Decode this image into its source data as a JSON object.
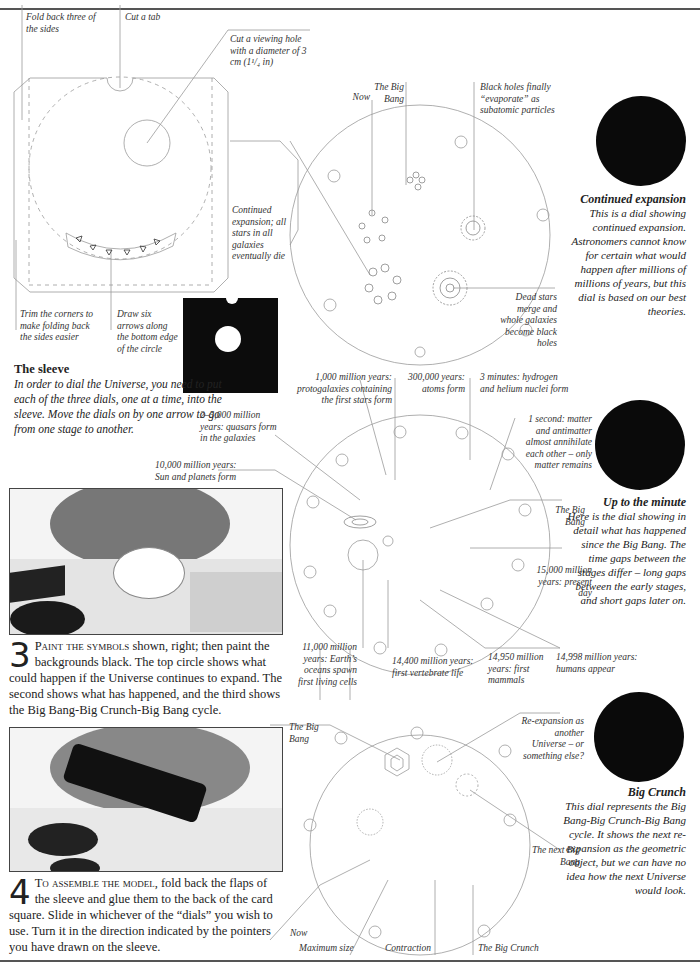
{
  "page": {
    "header_partial": "(cropped header text)"
  },
  "template_diagram": {
    "labels": {
      "fold_back": "Fold back three of the sides",
      "cut_tab": "Cut a tab",
      "viewing_hole": "Cut a viewing hole with a diameter of 3 cm (1¹/₄ in)",
      "trim_corners": "Trim the corners to make folding back the sides easier",
      "draw_arrows": "Draw six arrows along the bottom edge of the circle"
    },
    "arrow_count": 6
  },
  "sleeve": {
    "heading": "The sleeve",
    "body": "In order to dial the Universe, you need to put each of the three dials, one at a time, into the sleeve. Move the dials on by one arrow to go from one stage to another."
  },
  "steps": [
    {
      "number": "3",
      "lead": "Paint the symbols",
      "text": " shown, right; then paint the backgrounds black. The top circle shows what could happen if the Universe continues to expand. The second shows what has happened, and the third shows the Big Bang-Big Crunch-Big Bang cycle."
    },
    {
      "number": "4",
      "lead": "To assemble the model,",
      "text": " fold back the flaps of the sleeve and glue them to the back of the card square. Slide in whichever of the “dials” you wish to use. Turn it in the direction indicated by the pointers you have drawn on the sleeve."
    }
  ],
  "dials": [
    {
      "id": "continued-expansion",
      "labels": {
        "now": "Now",
        "big_bang": "The Big Bang",
        "black_holes": "Black holes finally “evaporate” as subatomic particles",
        "stars_die": "Continued expansion; all stars in all galaxies eventually die",
        "dead_stars": "Dead stars merge and whole galaxies become black holes"
      },
      "side_heading": "Continued expansion",
      "side_text": "This is a dial showing continued expansion. Astronomers cannot know for certain what would happen after millions of millions of years, but this dial is based on our best theories."
    },
    {
      "id": "up-to-the-minute",
      "labels": {
        "protogalaxies": "1,000 million years: protogalaxies containing the first stars form",
        "atoms": "300,000 years: atoms form",
        "nuclei": "3 minutes: hydrogen and helium nuclei form",
        "matter": "1 second: matter and antimatter almost annihilate each other – only matter remains",
        "quasars": "2–5,000 million years: quasars form in the galaxies",
        "sun": "10,000 million years: Sun and planets form",
        "big_bang": "The Big Bang",
        "present": "15,000 million years: present day",
        "oceans": "11,000 million years: Earth’s oceans spawn first living cells",
        "vertebrate": "14,400 million years: first vertebrate life",
        "mammals": "14,950 million years: first mammals",
        "humans": "14,998 million years: humans appear"
      },
      "side_heading": "Up to the minute",
      "side_text": "Here is the dial showing in detail what has happened since the Big Bang. The time gaps between the stages differ – long gaps between the early stages, and short gaps later on."
    },
    {
      "id": "big-crunch",
      "labels": {
        "big_bang": "The Big Bang",
        "reexpansion": "Re-expansion as another Universe – or something else?",
        "next_big_bang": "The next Big Bang",
        "now": "Now",
        "max_size": "Maximum size",
        "contraction": "Contraction",
        "big_crunch": "The Big Crunch"
      },
      "side_heading": "Big Crunch",
      "side_text": "This dial represents the Big Bang-Big Crunch-Big Bang cycle. It shows the next re-expansion as the geometric object, but we can have no idea how the next Universe would look."
    }
  ],
  "colors": {
    "line": "#999999",
    "text": "#222222",
    "dial_black": "#0a0a0a",
    "rule": "#555555"
  }
}
